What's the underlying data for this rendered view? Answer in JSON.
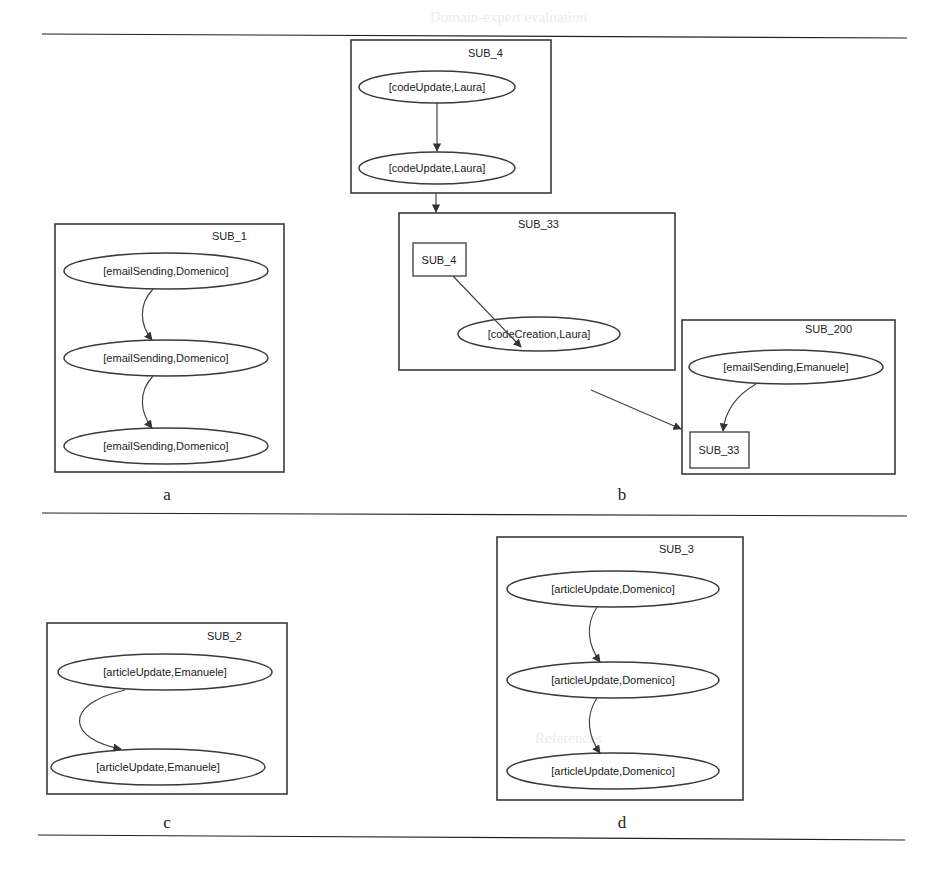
{
  "figure": {
    "panels": [
      {
        "caption": "a",
        "subgraph": "SUB_1",
        "nodes": [
          "[emailSending,Domenico]",
          "[emailSending,Domenico]",
          "[emailSending,Domenico]"
        ]
      },
      {
        "caption": "b",
        "subgraphs": [
          {
            "name": "SUB_4",
            "nodes": [
              "[codeUpdate,Laura]",
              "[codeUpdate,Laura]"
            ]
          },
          {
            "name": "SUB_33",
            "nodes": [
              "SUB_4",
              "[codeCreation,Laura]"
            ]
          },
          {
            "name": "SUB_200",
            "nodes": [
              "[emailSending,Emanuele]",
              "SUB_33"
            ]
          }
        ]
      },
      {
        "caption": "c",
        "subgraph": "SUB_2",
        "nodes": [
          "[articleUpdate,Emanuele]",
          "[articleUpdate,Emanuele]"
        ]
      },
      {
        "caption": "d",
        "subgraph": "SUB_3",
        "nodes": [
          "[articleUpdate,Domenico]",
          "[articleUpdate,Domenico]",
          "[articleUpdate,Domenico]"
        ]
      }
    ],
    "background_text": {
      "heading": "Domain-expert evaluation",
      "subheading": "References"
    }
  }
}
